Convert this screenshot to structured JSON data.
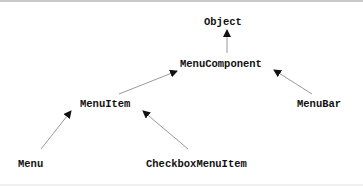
{
  "diagram": {
    "type": "class-hierarchy",
    "nodes": {
      "object": "Object",
      "menu_component": "MenuComponent",
      "menu_item": "MenuItem",
      "menu_bar": "MenuBar",
      "menu": "Menu",
      "checkbox_menu_item": "CheckboxMenuItem"
    },
    "edges": [
      {
        "from": "MenuComponent",
        "to": "Object"
      },
      {
        "from": "MenuItem",
        "to": "MenuComponent"
      },
      {
        "from": "MenuBar",
        "to": "MenuComponent"
      },
      {
        "from": "Menu",
        "to": "MenuItem"
      },
      {
        "from": "CheckboxMenuItem",
        "to": "MenuItem"
      }
    ],
    "colors": {
      "text": "#111111",
      "edge": "#9a9a9a",
      "arrowhead": "#111111",
      "background": "#ffffff"
    }
  }
}
